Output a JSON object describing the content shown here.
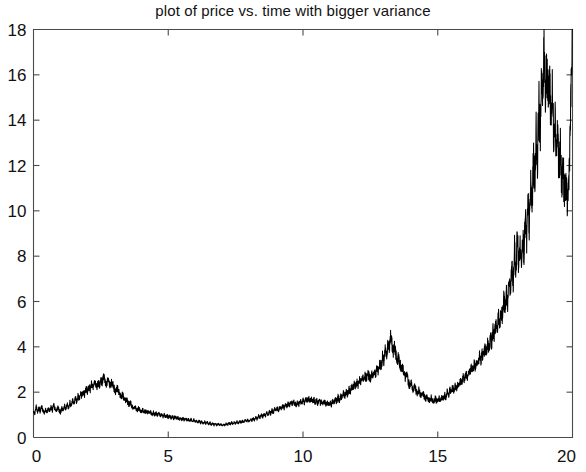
{
  "chart_data": {
    "type": "line",
    "title": "plot of price vs. time with bigger variance",
    "xlabel": "",
    "ylabel": "",
    "xlim": [
      0,
      20
    ],
    "ylim": [
      0,
      18
    ],
    "grid": false,
    "legend": null,
    "x_ticks": [
      0,
      5,
      10,
      15,
      20
    ],
    "x_tick_labels": [
      "0",
      "5",
      "10",
      "15",
      "20"
    ],
    "y_ticks": [
      0,
      2,
      4,
      6,
      8,
      10,
      12,
      14,
      16,
      18
    ],
    "y_tick_labels": [
      "0",
      "2",
      "4",
      "6",
      "8",
      "10",
      "12",
      "14",
      "16",
      "18"
    ],
    "series": [
      {
        "name": "price",
        "color": "#000000",
        "x": [
          0.0,
          0.05,
          0.1,
          0.15,
          0.2,
          0.25,
          0.3,
          0.35,
          0.4,
          0.45,
          0.5,
          0.55,
          0.6,
          0.65,
          0.7,
          0.75,
          0.8,
          0.85,
          0.9,
          0.95,
          1.0,
          1.05,
          1.1,
          1.15,
          1.2,
          1.25,
          1.3,
          1.35,
          1.4,
          1.45,
          1.5,
          1.55,
          1.6,
          1.65,
          1.7,
          1.75,
          1.8,
          1.85,
          1.9,
          1.95,
          2.0,
          2.05,
          2.1,
          2.15,
          2.2,
          2.25,
          2.3,
          2.35,
          2.4,
          2.45,
          2.5,
          2.55,
          2.6,
          2.65,
          2.7,
          2.75,
          2.8,
          2.85,
          2.9,
          2.95,
          3.0,
          3.05,
          3.1,
          3.15,
          3.2,
          3.25,
          3.3,
          3.35,
          3.4,
          3.45,
          3.5,
          3.55,
          3.6,
          3.65,
          3.7,
          3.75,
          3.8,
          3.85,
          3.9,
          3.95,
          4.0,
          4.05,
          4.1,
          4.15,
          4.2,
          4.25,
          4.3,
          4.35,
          4.4,
          4.45,
          4.5,
          4.55,
          4.6,
          4.65,
          4.7,
          4.75,
          4.8,
          4.85,
          4.9,
          4.95,
          5.0,
          5.05,
          5.1,
          5.15,
          5.2,
          5.25,
          5.3,
          5.35,
          5.4,
          5.45,
          5.5,
          5.55,
          5.6,
          5.65,
          5.7,
          5.75,
          5.8,
          5.85,
          5.9,
          5.95,
          6.0,
          6.05,
          6.1,
          6.15,
          6.2,
          6.25,
          6.3,
          6.35,
          6.4,
          6.45,
          6.5,
          6.55,
          6.6,
          6.65,
          6.7,
          6.75,
          6.8,
          6.85,
          6.9,
          6.95,
          7.0,
          7.05,
          7.1,
          7.15,
          7.2,
          7.25,
          7.3,
          7.35,
          7.4,
          7.45,
          7.5,
          7.55,
          7.6,
          7.65,
          7.7,
          7.75,
          7.8,
          7.85,
          7.9,
          7.95,
          8.0,
          8.05,
          8.1,
          8.15,
          8.2,
          8.25,
          8.3,
          8.35,
          8.4,
          8.45,
          8.5,
          8.55,
          8.6,
          8.65,
          8.7,
          8.75,
          8.8,
          8.85,
          8.9,
          8.95,
          9.0,
          9.05,
          9.1,
          9.15,
          9.2,
          9.25,
          9.3,
          9.35,
          9.4,
          9.45,
          9.5,
          9.55,
          9.6,
          9.65,
          9.7,
          9.75,
          9.8,
          9.85,
          9.9,
          9.95,
          10.0,
          10.05,
          10.1,
          10.15,
          10.2,
          10.25,
          10.3,
          10.35,
          10.4,
          10.45,
          10.5,
          10.55,
          10.6,
          10.65,
          10.7,
          10.75,
          10.8,
          10.85,
          10.9,
          10.95,
          11.0,
          11.05,
          11.1,
          11.15,
          11.2,
          11.25,
          11.3,
          11.35,
          11.4,
          11.45,
          11.5,
          11.55,
          11.6,
          11.65,
          11.7,
          11.75,
          11.8,
          11.85,
          11.9,
          11.95,
          12.0,
          12.05,
          12.1,
          12.15,
          12.2,
          12.25,
          12.3,
          12.35,
          12.4,
          12.45,
          12.5,
          12.55,
          12.6,
          12.65,
          12.7,
          12.75,
          12.8,
          12.85,
          12.9,
          12.95,
          13.0,
          13.05,
          13.1,
          13.15,
          13.2,
          13.25,
          13.3,
          13.35,
          13.4,
          13.45,
          13.5,
          13.55,
          13.6,
          13.65,
          13.7,
          13.75,
          13.8,
          13.85,
          13.9,
          13.95,
          14.0,
          14.05,
          14.1,
          14.15,
          14.2,
          14.25,
          14.3,
          14.35,
          14.4,
          14.45,
          14.5,
          14.55,
          14.6,
          14.65,
          14.7,
          14.75,
          14.8,
          14.85,
          14.9,
          14.95,
          15.0,
          15.05,
          15.1,
          15.15,
          15.2,
          15.25,
          15.3,
          15.35,
          15.4,
          15.45,
          15.5,
          15.55,
          15.6,
          15.65,
          15.7,
          15.75,
          15.8,
          15.85,
          15.9,
          15.95,
          16.0,
          16.05,
          16.1,
          16.15,
          16.2,
          16.25,
          16.3,
          16.35,
          16.4,
          16.45,
          16.5,
          16.55,
          16.6,
          16.65,
          16.7,
          16.75,
          16.8,
          16.85,
          16.9,
          16.95,
          17.0,
          17.05,
          17.1,
          17.15,
          17.2,
          17.25,
          17.3,
          17.35,
          17.4,
          17.45,
          17.5,
          17.55,
          17.6,
          17.65,
          17.7,
          17.75,
          17.8,
          17.85,
          17.9,
          17.95,
          18.0,
          18.05,
          18.1,
          18.15,
          18.2,
          18.25,
          18.3,
          18.35,
          18.4,
          18.45,
          18.5,
          18.55,
          18.6,
          18.65,
          18.7,
          18.75,
          18.8,
          18.85,
          18.9,
          18.95,
          19.0,
          19.05,
          19.1,
          19.15,
          19.2,
          19.25,
          19.3,
          19.35,
          19.4,
          19.45,
          19.5,
          19.55,
          19.6,
          19.65,
          19.7,
          19.75,
          19.8,
          19.85,
          19.9,
          19.95,
          20.0
        ],
        "y": [
          1.2,
          1.05,
          1.35,
          1.1,
          1.3,
          1.15,
          1.4,
          1.2,
          1.05,
          1.25,
          1.1,
          1.3,
          1.15,
          1.35,
          1.2,
          1.45,
          1.25,
          1.15,
          1.35,
          1.2,
          1.1,
          1.3,
          1.15,
          1.4,
          1.25,
          1.45,
          1.3,
          1.55,
          1.4,
          1.65,
          1.5,
          1.75,
          1.6,
          1.85,
          1.7,
          1.95,
          1.8,
          2.05,
          1.9,
          2.15,
          2.05,
          2.25,
          2.1,
          2.35,
          2.2,
          2.45,
          2.3,
          2.2,
          2.4,
          2.25,
          2.55,
          2.4,
          2.7,
          2.5,
          2.35,
          2.55,
          2.4,
          2.25,
          2.45,
          2.3,
          2.15,
          2.0,
          2.2,
          2.05,
          1.9,
          1.75,
          1.9,
          1.75,
          1.6,
          1.7,
          1.55,
          1.45,
          1.55,
          1.4,
          1.3,
          1.4,
          1.28,
          1.2,
          1.32,
          1.22,
          1.12,
          1.22,
          1.1,
          1.18,
          1.08,
          1.15,
          1.05,
          1.12,
          1.02,
          1.1,
          1.0,
          1.08,
          0.98,
          1.05,
          0.95,
          1.02,
          0.92,
          1.0,
          0.9,
          0.98,
          0.88,
          0.96,
          0.86,
          0.94,
          0.84,
          0.92,
          0.82,
          0.9,
          0.8,
          0.88,
          0.78,
          0.86,
          0.76,
          0.84,
          0.74,
          0.82,
          0.72,
          0.8,
          0.7,
          0.78,
          0.68,
          0.76,
          0.66,
          0.74,
          0.64,
          0.72,
          0.62,
          0.7,
          0.6,
          0.68,
          0.58,
          0.66,
          0.56,
          0.64,
          0.55,
          0.63,
          0.54,
          0.62,
          0.53,
          0.61,
          0.52,
          0.6,
          0.54,
          0.62,
          0.56,
          0.64,
          0.58,
          0.66,
          0.6,
          0.68,
          0.62,
          0.7,
          0.64,
          0.72,
          0.66,
          0.74,
          0.68,
          0.76,
          0.7,
          0.78,
          0.72,
          0.8,
          0.74,
          0.85,
          0.78,
          0.9,
          0.82,
          0.95,
          0.86,
          1.0,
          0.9,
          1.05,
          0.95,
          1.1,
          1.0,
          1.15,
          1.05,
          1.2,
          1.1,
          1.25,
          1.15,
          1.3,
          1.2,
          1.35,
          1.25,
          1.4,
          1.3,
          1.45,
          1.35,
          1.5,
          1.4,
          1.55,
          1.45,
          1.6,
          1.5,
          1.42,
          1.55,
          1.46,
          1.6,
          1.5,
          1.65,
          1.55,
          1.7,
          1.6,
          1.75,
          1.62,
          1.72,
          1.58,
          1.68,
          1.55,
          1.65,
          1.52,
          1.62,
          1.5,
          1.6,
          1.48,
          1.58,
          1.46,
          1.56,
          1.44,
          1.54,
          1.45,
          1.6,
          1.5,
          1.68,
          1.58,
          1.78,
          1.65,
          1.85,
          1.72,
          1.95,
          1.8,
          2.05,
          1.9,
          2.15,
          2.0,
          2.25,
          2.1,
          2.35,
          2.2,
          2.45,
          2.3,
          2.55,
          2.4,
          2.65,
          2.5,
          2.75,
          2.6,
          2.85,
          2.7,
          2.6,
          2.8,
          2.7,
          2.95,
          2.8,
          3.1,
          2.95,
          3.3,
          3.1,
          3.55,
          3.3,
          3.85,
          3.55,
          4.2,
          3.9,
          4.5,
          4.1,
          3.8,
          4.05,
          3.7,
          3.35,
          3.6,
          3.25,
          2.95,
          3.15,
          2.85,
          2.6,
          2.75,
          2.5,
          2.3,
          2.45,
          2.25,
          2.1,
          2.25,
          2.05,
          1.95,
          2.1,
          1.9,
          1.8,
          1.95,
          1.78,
          1.7,
          1.85,
          1.68,
          1.62,
          1.78,
          1.65,
          1.6,
          1.75,
          1.62,
          1.58,
          1.72,
          1.6,
          1.78,
          1.68,
          1.9,
          1.78,
          2.0,
          1.88,
          2.1,
          1.98,
          2.2,
          2.08,
          2.3,
          2.18,
          2.42,
          2.28,
          2.55,
          2.4,
          2.7,
          2.55,
          2.85,
          2.7,
          3.0,
          2.85,
          3.15,
          2.98,
          3.3,
          3.1,
          3.45,
          3.25,
          3.6,
          3.38,
          3.75,
          3.52,
          3.95,
          3.7,
          4.2,
          3.9,
          4.45,
          4.15,
          4.75,
          4.4,
          5.05,
          4.65,
          5.4,
          4.95,
          5.75,
          5.25,
          6.1,
          5.55,
          6.5,
          5.85,
          7.0,
          6.3,
          7.6,
          6.7,
          8.3,
          7.2,
          9.1,
          7.6,
          8.4,
          7.8,
          8.9,
          8.2,
          9.6,
          8.6,
          10.4,
          9.2,
          11.3,
          10.0,
          12.4,
          11.0,
          13.5,
          12.1,
          14.9,
          13.2,
          16.3,
          14.5,
          17.8,
          15.2,
          16.4,
          14.8,
          16.0,
          14.2,
          15.2,
          13.4,
          14.4,
          12.6,
          13.6,
          11.8,
          12.7,
          11.2,
          12.0,
          10.6,
          11.4,
          10.2,
          11.0,
          12.8,
          15.4,
          18.0
        ]
      }
    ]
  },
  "axes": {
    "frame_color": "#4a4a4a",
    "background": "#ffffff"
  }
}
